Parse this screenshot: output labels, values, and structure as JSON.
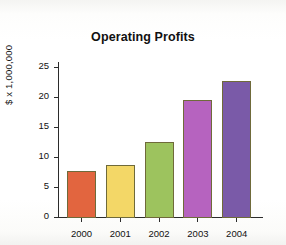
{
  "chart_data": {
    "type": "bar",
    "title": "Operating Profits",
    "xlabel": "",
    "ylabel": "$ x 1,000,000",
    "categories": [
      "2000",
      "2001",
      "2002",
      "2003",
      "2004"
    ],
    "values": [
      7.8,
      8.9,
      12.7,
      19.7,
      22.8
    ],
    "ylim": [
      0,
      26
    ],
    "yticks": [
      0,
      5,
      10,
      15,
      20,
      25
    ],
    "ytick_labels": [
      "0",
      "5",
      "10",
      "15",
      "20",
      "25"
    ],
    "grid": false,
    "legend": false,
    "bar_colors": [
      "#e2653f",
      "#f3d767",
      "#9dc35e",
      "#b663bf",
      "#7a5aa8"
    ],
    "bar_edge_color": "#6f6a3a",
    "axis_color": "#2b2b2b",
    "background_color": "#ffffff"
  },
  "figure": {
    "title": "Operating Profits",
    "y_axis_title": "$ x 1,000,000"
  }
}
